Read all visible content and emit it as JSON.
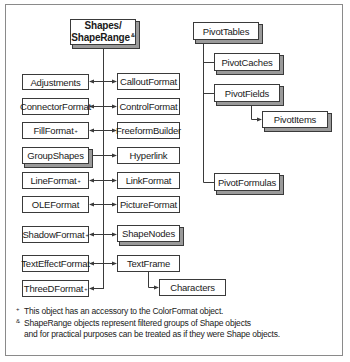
{
  "diagram": {
    "root": {
      "line1": "Shapes/",
      "line2": "ShapeRange",
      "marker": "&"
    },
    "left_column": [
      {
        "label": "Adjustments",
        "marker": ""
      },
      {
        "label": "ConnectorFormat",
        "marker": ""
      },
      {
        "label": "FillFormat",
        "marker": "+"
      },
      {
        "label": "GroupShapes",
        "marker": "",
        "collection": true
      },
      {
        "label": "LineFormat",
        "marker": "+"
      },
      {
        "label": "OLEFormat",
        "marker": ""
      },
      {
        "label": "ShadowFormat",
        "marker": "+"
      },
      {
        "label": "TextEffectFormat",
        "marker": ""
      },
      {
        "label": "ThreeDFormat",
        "marker": "+"
      }
    ],
    "right_column": [
      {
        "label": "CalloutFormat"
      },
      {
        "label": "ControlFormat"
      },
      {
        "label": "FreeformBuilder"
      },
      {
        "label": "Hyperlink"
      },
      {
        "label": "LinkFormat"
      },
      {
        "label": "PictureFormat"
      },
      {
        "label": "ShapeNodes",
        "collection": true
      },
      {
        "label": "TextFrame"
      }
    ],
    "textframe_child": {
      "label": "Characters"
    },
    "pivot": {
      "root": {
        "label": "PivotTables",
        "collection": true
      },
      "children": [
        {
          "label": "PivotCaches",
          "collection": true
        },
        {
          "label": "PivotFields",
          "collection": true
        },
        {
          "label": "PivotFormulas",
          "collection": true
        }
      ],
      "pivotfields_child": {
        "label": "PivotItems",
        "collection": true
      }
    }
  },
  "footnotes": [
    {
      "marker": "+",
      "text": "This object has an accessory to the ColorFormat object."
    },
    {
      "marker": "&",
      "text": "ShapeRange objects represent  filtered groups of Shape objects"
    },
    {
      "marker": "",
      "text": "and for practical purposes can be treated as if they were Shape objects."
    }
  ]
}
